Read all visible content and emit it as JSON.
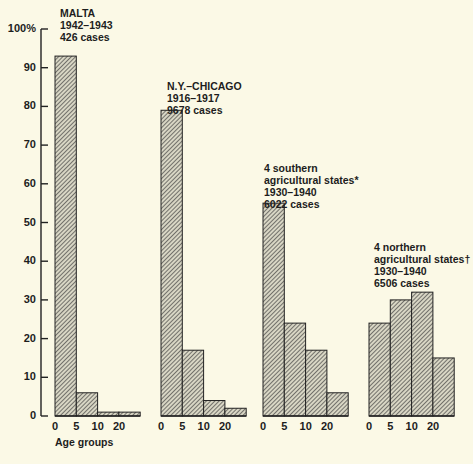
{
  "chart_data": {
    "type": "bar",
    "title": "",
    "xlabel": "Age groups",
    "ylabel": "%",
    "ylim": [
      0,
      100
    ],
    "yticks": [
      "100%",
      "90",
      "80",
      "70",
      "60",
      "50",
      "40",
      "30",
      "20",
      "10",
      "0"
    ],
    "categories": [
      "0-5",
      "5-10",
      "10-20",
      "20+"
    ],
    "xtick_labels": [
      "0",
      "5",
      "10",
      "20"
    ],
    "grid": false,
    "legend": "none",
    "series": [
      {
        "name": "MALTA 1942-1943 426 cases",
        "title_lines": [
          "MALTA",
          "1942–1943",
          "426 cases"
        ],
        "values": [
          93,
          6,
          1,
          1
        ]
      },
      {
        "name": "N.Y.-CHICAGO 1916-1917 9678 cases",
        "title_lines": [
          "N.Y.–CHICAGO",
          "1916–1917",
          "9678 cases"
        ],
        "values": [
          79,
          17,
          4,
          2
        ]
      },
      {
        "name": "4 southern agricultural states* 1930-1940 6022 cases",
        "title_lines": [
          "4 southern",
          "agricultural states*",
          "1930–1940",
          "6022 cases"
        ],
        "values": [
          55,
          24,
          17,
          6
        ]
      },
      {
        "name": "4 northern agricultural states† 1930-1940 6506 cases",
        "title_lines": [
          "4 northern",
          "agricultural states†",
          "1930–1940",
          "6506 cases"
        ],
        "values": [
          24,
          30,
          32,
          15
        ]
      }
    ]
  }
}
